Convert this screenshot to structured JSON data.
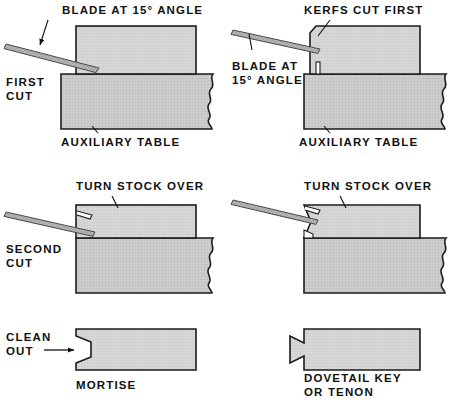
{
  "figure": {
    "background_color": "#ffffff",
    "ink_color": "#111111",
    "stock_fill": "#d6d6d6",
    "table_fill": "#c9c9c9",
    "blade_fill": "#b0b0b0"
  },
  "panels": [
    {
      "id": "first-cut",
      "row": 1,
      "column": "left",
      "stage_label": {
        "line1": "FIRST",
        "line2": "CUT"
      },
      "callouts": [
        {
          "name": "blade-angle",
          "text": "BLADE AT 15° ANGLE",
          "degree_value": "15",
          "has_leader": true
        },
        {
          "name": "auxiliary-table",
          "text": "AUXILIARY TABLE",
          "has_leader": true
        }
      ]
    },
    {
      "id": "kerfs-cut-first",
      "row": 1,
      "column": "right",
      "stage_label": null,
      "callouts": [
        {
          "name": "kerfs",
          "text": "KERFS CUT FIRST",
          "has_leader": true
        },
        {
          "name": "blade-angle",
          "line1": "BLADE AT",
          "line2": "15° ANGLE",
          "degree_value": "15",
          "has_leader": true
        },
        {
          "name": "auxiliary-table",
          "text": "AUXILIARY TABLE",
          "has_leader": true
        }
      ]
    },
    {
      "id": "second-cut-mortise",
      "row": 2,
      "column": "left",
      "stage_label": {
        "line1": "SECOND",
        "line2": "CUT"
      },
      "callouts": [
        {
          "name": "turn-stock-over",
          "text": "TURN STOCK OVER",
          "has_leader": true
        }
      ]
    },
    {
      "id": "second-cut-tenon",
      "row": 2,
      "column": "right",
      "stage_label": null,
      "callouts": [
        {
          "name": "turn-stock-over",
          "text": "TURN STOCK OVER",
          "has_leader": true
        }
      ]
    },
    {
      "id": "mortise-result",
      "row": 3,
      "column": "left",
      "stage_label": {
        "line1": "CLEAN",
        "line2": "OUT"
      },
      "callouts": [
        {
          "name": "mortise-caption",
          "text": "MORTISE",
          "has_leader": false
        }
      ]
    },
    {
      "id": "dovetail-key-result",
      "row": 3,
      "column": "right",
      "stage_label": null,
      "callouts": [
        {
          "name": "dovetail-caption",
          "line1": "DOVETAIL KEY",
          "line2": "OR TENON",
          "has_leader": false
        }
      ]
    }
  ],
  "text": {
    "blade_at_15_angle": "BLADE AT 15° ANGLE",
    "blade_at": "BLADE AT",
    "angle_15": "15° ANGLE",
    "kerfs_cut_first": "KERFS CUT FIRST",
    "auxiliary_table": "AUXILIARY TABLE",
    "first": "FIRST",
    "cut": "CUT",
    "second": "SECOND",
    "turn_stock_over": "TURN STOCK OVER",
    "clean": "CLEAN",
    "out": "OUT",
    "mortise": "MORTISE",
    "dovetail_key": "DOVETAIL KEY",
    "or_tenon": "OR TENON"
  }
}
